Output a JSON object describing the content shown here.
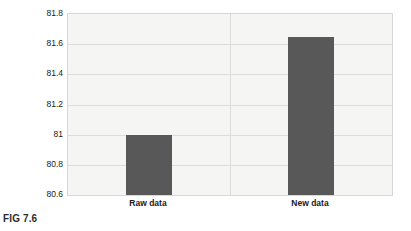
{
  "caption": "FIG 7.6",
  "chart_data": {
    "type": "bar",
    "title": "",
    "subtitle": "",
    "xlabel": "",
    "ylabel": "",
    "categories": [
      "Raw data",
      "New data"
    ],
    "values": [
      81.0,
      81.65
    ],
    "series": [
      {
        "name": "",
        "values": [
          81.0,
          81.65
        ]
      }
    ],
    "ylim": [
      80.6,
      81.8
    ],
    "ytick_labels": [
      "81.8",
      "81.6",
      "81.4",
      "81.2",
      "81",
      "80.8",
      "80.6"
    ],
    "ytick_values": [
      81.8,
      81.6,
      81.4,
      81.2,
      81.0,
      80.8,
      80.6
    ],
    "grid": true,
    "legend": false,
    "legend_position": "none",
    "bar_color": "#575857",
    "plot_background": "#f5f5f3",
    "gridline_color": "#dcdcda",
    "figure_background": "#ffffff"
  }
}
